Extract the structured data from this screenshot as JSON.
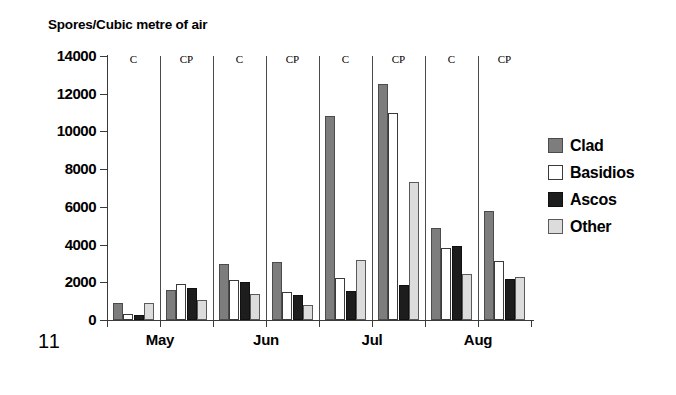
{
  "page_number": "11",
  "chart_data": {
    "type": "bar",
    "title": "Spores/Cubic metre of air",
    "xlabel": "",
    "ylabel": "Spores/Cubic metre of air",
    "ylim": [
      0,
      14000
    ],
    "ytick_step": 2000,
    "ytick_labels": [
      "14000",
      "12000",
      "10000",
      "8000",
      "6000",
      "4000",
      "2000",
      "0"
    ],
    "ytick_values": [
      14000,
      12000,
      10000,
      8000,
      6000,
      4000,
      2000,
      0
    ],
    "grid": false,
    "legend_position": "right",
    "months": [
      "May",
      "Jun",
      "Jul",
      "Aug"
    ],
    "conditions": [
      "C",
      "CP"
    ],
    "categories": [
      "May C",
      "May CP",
      "Jun C",
      "Jun CP",
      "Jul C",
      "Jul CP",
      "Aug C",
      "Aug CP"
    ],
    "series": [
      {
        "name": "Clad",
        "color": "#7d7d7d",
        "values": [
          900,
          1600,
          2950,
          3100,
          10800,
          12500,
          4900,
          5800
        ]
      },
      {
        "name": "Basidios",
        "color": "#ffffff",
        "values": [
          300,
          1900,
          2100,
          1500,
          2250,
          11000,
          3800,
          3150
        ]
      },
      {
        "name": "Ascos",
        "color": "#1d1d1d",
        "values": [
          250,
          1700,
          2000,
          1350,
          1550,
          1850,
          3900,
          2200
        ]
      },
      {
        "name": "Other",
        "color": "#dcdcdc",
        "values": [
          900,
          1050,
          1400,
          800,
          3200,
          7300,
          2450,
          2300
        ]
      }
    ]
  }
}
